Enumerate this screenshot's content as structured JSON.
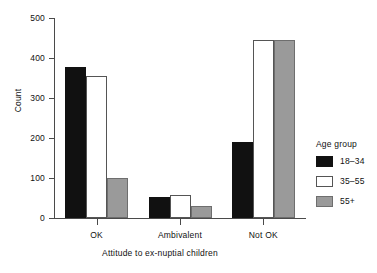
{
  "chart_data": {
    "type": "bar",
    "title": "",
    "xlabel": "Attitude to ex-nuptial children",
    "ylabel": "Count",
    "categories": [
      "OK",
      "Ambivalent",
      "Not OK"
    ],
    "series": [
      {
        "name": "18–34",
        "color": "#111111",
        "values": [
          378,
          52,
          190
        ]
      },
      {
        "name": "35–55",
        "color": "#ffffff",
        "values": [
          355,
          57,
          444
        ]
      },
      {
        "name": "55+",
        "color": "#9a9a9a",
        "values": [
          101,
          30,
          444
        ]
      }
    ],
    "ylim": [
      0,
      500
    ],
    "yticks": [
      0,
      100,
      200,
      300,
      400,
      500
    ],
    "ytick_labels": [
      "0",
      "100",
      "200",
      "300",
      "400",
      "500"
    ],
    "grid": false,
    "legend": {
      "title": "Age group",
      "position": "right",
      "entries": [
        "18–34",
        "35–55",
        "55+"
      ]
    }
  }
}
